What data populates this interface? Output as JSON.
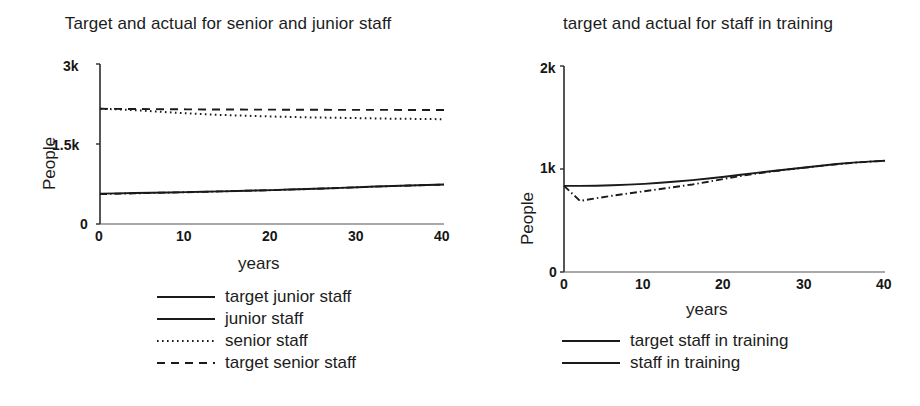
{
  "figure": {
    "background": "#ffffff",
    "ink_color": "#1a1a1a"
  },
  "charts": [
    {
      "id": "left",
      "title": "Target and actual for senior and junior staff",
      "ylabel": "People",
      "xlabel": "years",
      "ytick_labels": [
        "3k",
        "1.5k",
        "0"
      ],
      "xtick_labels": [
        "0",
        "10",
        "20",
        "30",
        "40"
      ],
      "legend": [
        {
          "label": "target junior staff",
          "style": "solid"
        },
        {
          "label": "junior staff",
          "style": "dashdot"
        },
        {
          "label": "senior staff",
          "style": "dotted"
        },
        {
          "label": "target senior staff",
          "style": "dashed"
        }
      ]
    },
    {
      "id": "right",
      "title": "target and actual for staff in training",
      "ylabel": "People",
      "xlabel": "years",
      "ytick_labels": [
        "2k",
        "1k",
        "0"
      ],
      "xtick_labels": [
        "0",
        "10",
        "20",
        "30",
        "40"
      ],
      "legend": [
        {
          "label": "target staff in training",
          "style": "solid"
        },
        {
          "label": "staff in training",
          "style": "dashdot"
        }
      ]
    }
  ],
  "chart_data": [
    {
      "type": "line",
      "title": "Target and actual for senior and junior staff",
      "xlabel": "years",
      "ylabel": "People",
      "xlim": [
        0,
        40
      ],
      "ylim": [
        0,
        3000
      ],
      "xticks": [
        0,
        10,
        20,
        30,
        40
      ],
      "yticks": [
        0,
        1500,
        3000
      ],
      "ytick_labels": [
        "0",
        "1.5k",
        "3k"
      ],
      "grid": false,
      "legend_position": "below",
      "x": [
        0,
        2,
        4,
        6,
        8,
        10,
        12,
        14,
        16,
        18,
        20,
        22,
        24,
        26,
        28,
        30,
        32,
        34,
        36,
        38,
        40
      ],
      "series": [
        {
          "name": "target junior staff",
          "style": "solid",
          "values": [
            570,
            575,
            580,
            586,
            592,
            598,
            605,
            612,
            620,
            628,
            636,
            646,
            656,
            667,
            678,
            690,
            702,
            712,
            722,
            732,
            740
          ]
        },
        {
          "name": "junior staff",
          "style": "dash-dot",
          "values": [
            560,
            568,
            575,
            582,
            589,
            596,
            603,
            611,
            619,
            627,
            635,
            645,
            655,
            666,
            677,
            689,
            701,
            711,
            721,
            731,
            739
          ]
        },
        {
          "name": "senior staff",
          "style": "dotted",
          "values": [
            2160,
            2150,
            2135,
            2115,
            2095,
            2075,
            2060,
            2045,
            2035,
            2025,
            2015,
            2008,
            2000,
            1995,
            1990,
            1985,
            1980,
            1975,
            1972,
            1968,
            1965
          ]
        },
        {
          "name": "target senior staff",
          "style": "dashed",
          "values": [
            2160,
            2158,
            2156,
            2154,
            2152,
            2150,
            2148,
            2147,
            2146,
            2145,
            2144,
            2143,
            2142,
            2141,
            2140,
            2140,
            2139,
            2139,
            2138,
            2138,
            2138
          ]
        }
      ]
    },
    {
      "type": "line",
      "title": "target and actual for staff in training",
      "xlabel": "years",
      "ylabel": "People",
      "xlim": [
        0,
        40
      ],
      "ylim": [
        0,
        2000
      ],
      "xticks": [
        0,
        10,
        20,
        30,
        40
      ],
      "yticks": [
        0,
        1000,
        2000
      ],
      "ytick_labels": [
        "0",
        "1k",
        "2k"
      ],
      "grid": false,
      "legend_position": "below",
      "x": [
        0,
        2,
        4,
        6,
        8,
        10,
        12,
        14,
        16,
        18,
        20,
        22,
        24,
        26,
        28,
        30,
        32,
        34,
        36,
        38,
        40
      ],
      "series": [
        {
          "name": "target staff in training",
          "style": "solid",
          "values": [
            836,
            836,
            838,
            842,
            848,
            856,
            866,
            878,
            892,
            908,
            925,
            944,
            962,
            980,
            998,
            1015,
            1032,
            1048,
            1062,
            1072,
            1080
          ]
        },
        {
          "name": "staff in training",
          "style": "dash-dot",
          "values": [
            836,
            690,
            716,
            740,
            762,
            784,
            806,
            828,
            850,
            876,
            905,
            932,
            956,
            977,
            996,
            1013,
            1030,
            1046,
            1060,
            1071,
            1079
          ]
        }
      ]
    }
  ]
}
